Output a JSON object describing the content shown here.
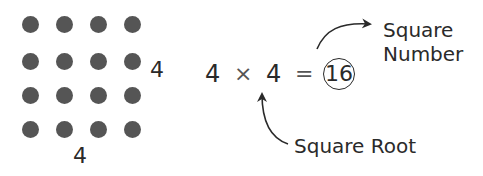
{
  "diagram": {
    "dot_grid": {
      "rows": 4,
      "cols": 4,
      "color": "#555555"
    },
    "side_label": "4",
    "bottom_label": "4",
    "equation": {
      "left_operand": "4",
      "operator": "×",
      "right_operand": "4",
      "equals": "=",
      "result": "16"
    },
    "annotations": {
      "square_number_line1": "Square",
      "square_number_line2": "Number",
      "square_root": "Square Root"
    }
  }
}
